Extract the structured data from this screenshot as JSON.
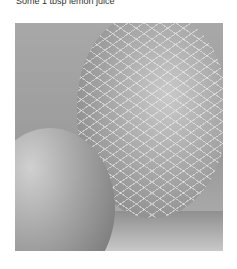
{
  "caption": {
    "text": "Some 1 tbsp lemon juice"
  },
  "photo": {
    "description": "Black-and-white photo of a lemon in a mesh net beside an orange"
  }
}
